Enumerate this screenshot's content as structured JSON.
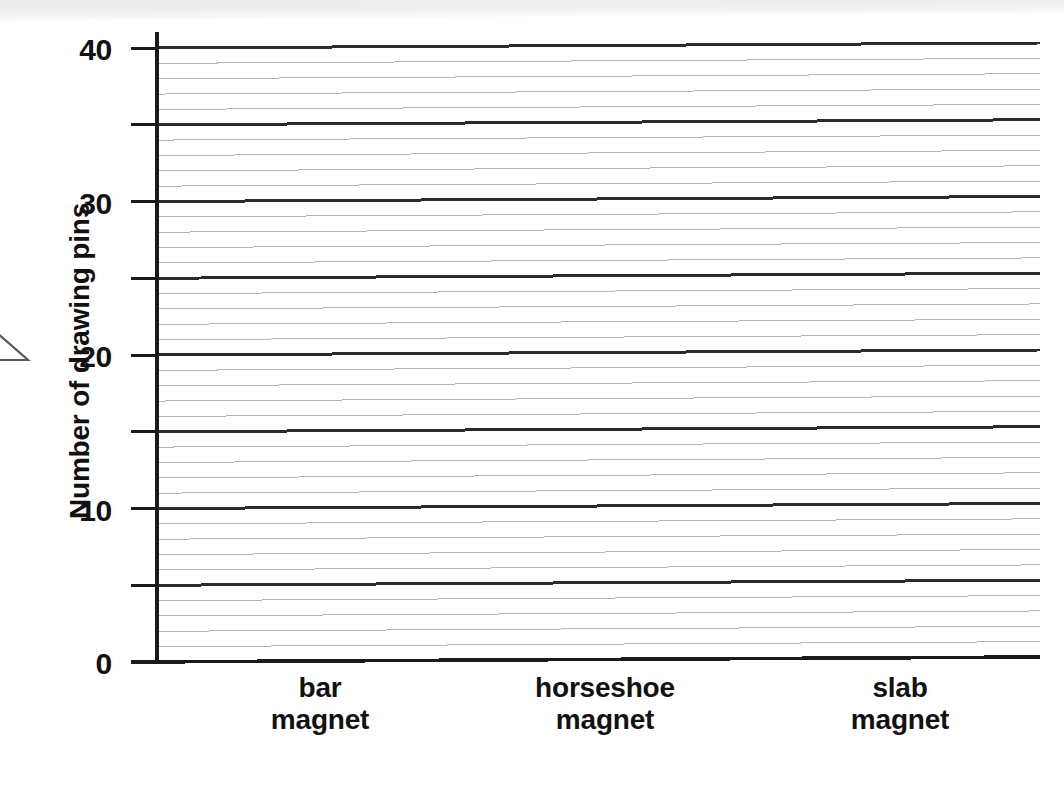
{
  "chart_data": {
    "type": "bar",
    "title": "",
    "subtitle": "",
    "xlabel": "",
    "ylabel": "Number of drawing pins",
    "categories": [
      "bar magnet",
      "horseshoe magnet",
      "slab magnet"
    ],
    "category_lines": [
      [
        "bar",
        "magnet"
      ],
      [
        "horseshoe",
        "magnet"
      ],
      [
        "slab",
        "magnet"
      ]
    ],
    "values": [
      null,
      null,
      null
    ],
    "series": [
      {
        "name": "Number of drawing pins",
        "values": [
          null,
          null,
          null
        ]
      }
    ],
    "ylim": [
      0,
      40
    ],
    "y_major_tick_labels": [
      "0",
      "10",
      "20",
      "30",
      "40"
    ],
    "y_major_tick_values": [
      0,
      10,
      20,
      30,
      40
    ],
    "y_minor_gridline_interval": 1,
    "y_bold_gridline_interval": 5,
    "y_tick_mark_values": [
      0,
      5,
      10,
      15,
      20,
      25,
      30,
      35,
      40
    ],
    "grid": "horizontal-only",
    "legend": "none",
    "legend_position": "none",
    "annotations": [],
    "note": "Blank grid template; no bars plotted",
    "colors": {
      "background": "#ffffff",
      "axis": "#1a1a1a",
      "bold_gridline": "#2b2b2b",
      "minor_gridline": "#b4b4b4",
      "text": "#111111",
      "scan_band": "#ececec"
    }
  },
  "axis": {
    "y_title": "Number of drawing pins",
    "ticks": [
      {
        "value": 40,
        "label": "40"
      },
      {
        "value": 30,
        "label": "30"
      },
      {
        "value": 20,
        "label": "20"
      },
      {
        "value": 10,
        "label": "10"
      },
      {
        "value": 0,
        "label": "0"
      }
    ]
  },
  "categories": [
    {
      "line1": "bar",
      "line2": "magnet"
    },
    {
      "line1": "horseshoe",
      "line2": "magnet"
    },
    {
      "line1": "slab",
      "line2": "magnet"
    }
  ]
}
